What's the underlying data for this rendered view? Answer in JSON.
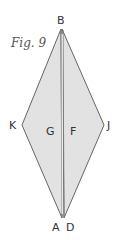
{
  "figure": {
    "caption": "Fig. 9",
    "colors": {
      "fill": "#e2e2e2",
      "stroke": "#666666",
      "crease": "#8a8a8a",
      "label": "#333333"
    },
    "vertices": {
      "top": {
        "name": "B",
        "x": 61,
        "y": 29
      },
      "left": {
        "name": "K",
        "x": 22,
        "y": 125
      },
      "right": {
        "name": "J",
        "x": 104,
        "y": 125
      },
      "bottom": {
        "name": "A/D",
        "x": 63,
        "y": 218
      }
    },
    "labels": {
      "top": "B",
      "left": "K",
      "right": "J",
      "bottom_left": "A",
      "bottom_right": "D",
      "region_left": "G",
      "region_right": "F"
    }
  }
}
